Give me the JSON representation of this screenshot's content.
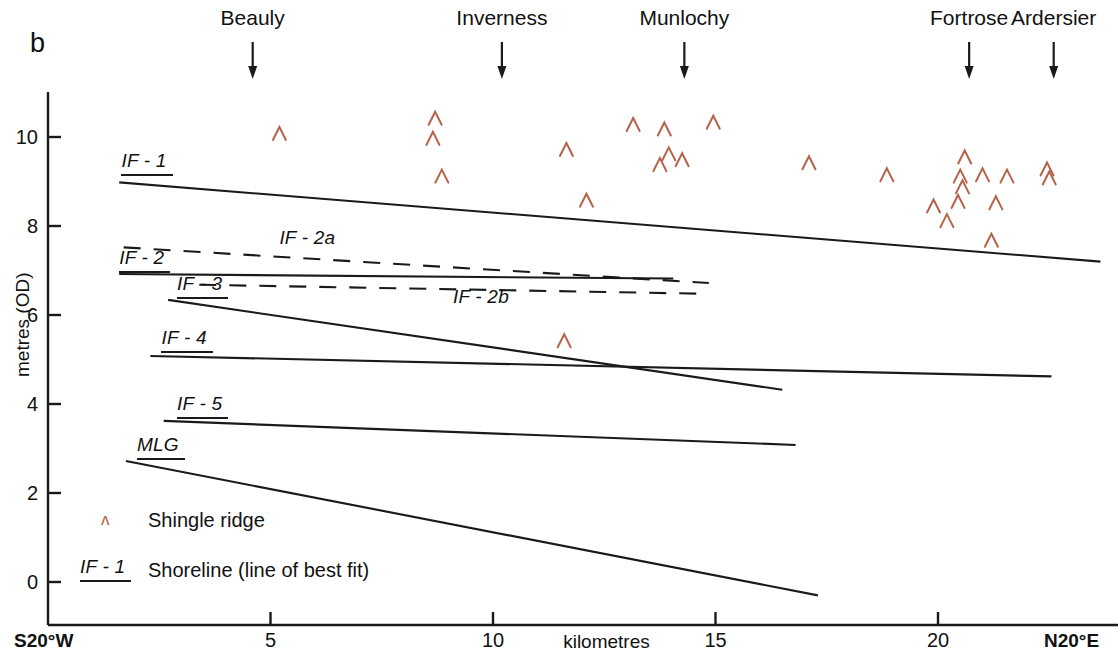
{
  "figure": {
    "panel_letter": "b",
    "background_color": "#ffffff",
    "line_color": "#1a1a1a",
    "marker_color": "#b5634a"
  },
  "axes": {
    "y_title": "metres (OD)",
    "x_title": "kilometres",
    "y_ticks": [
      {
        "value": 0,
        "label": "0"
      },
      {
        "value": 2,
        "label": "2"
      },
      {
        "value": 4,
        "label": "4"
      },
      {
        "value": 6,
        "label": "6"
      },
      {
        "value": 8,
        "label": "8"
      },
      {
        "value": 10,
        "label": "10"
      }
    ],
    "x_ticks": [
      {
        "value": 5,
        "label": "5"
      },
      {
        "value": 10,
        "label": "10"
      },
      {
        "value": 15,
        "label": "15"
      },
      {
        "value": 20,
        "label": "20"
      }
    ],
    "x_start_label": "S20°W",
    "x_end_label": "N20°E",
    "xlim": [
      0,
      23.8
    ],
    "ylim": [
      -1.0,
      10.9
    ],
    "grid": false
  },
  "locations": [
    {
      "name": "Beauly",
      "km": 4.6
    },
    {
      "name": "Inverness",
      "km": 10.2
    },
    {
      "name": "Munlochy",
      "km": 14.3
    },
    {
      "name": "Fortrose",
      "km": 20.7
    },
    {
      "name": "Ardersier",
      "km": 22.6
    }
  ],
  "legend": {
    "marker_glyph": "ʌ",
    "marker_label": "Shingle ridge",
    "line_key": "IF - 1",
    "line_label": "Shoreline (line of best fit)"
  },
  "chart_data": {
    "type": "scatter",
    "title": "",
    "xlabel": "kilometres",
    "ylabel": "metres (OD)",
    "xlim": [
      0,
      23.8
    ],
    "ylim": [
      -1.0,
      10.9
    ],
    "grid": false,
    "legend_position": "lower-left",
    "series": [
      {
        "name": "Shingle ridge",
        "type": "scatter",
        "marker": "caret",
        "color": "#b5634a",
        "points": [
          [
            5.2,
            10.08
          ],
          [
            8.7,
            10.42
          ],
          [
            8.65,
            9.97
          ],
          [
            8.85,
            9.12
          ],
          [
            11.65,
            9.72
          ],
          [
            12.1,
            8.58
          ],
          [
            13.15,
            10.28
          ],
          [
            13.85,
            10.18
          ],
          [
            14.95,
            10.33
          ],
          [
            13.95,
            9.62
          ],
          [
            14.25,
            9.49
          ],
          [
            13.75,
            9.38
          ],
          [
            17.1,
            9.42
          ],
          [
            18.85,
            9.15
          ],
          [
            20.6,
            9.55
          ],
          [
            20.5,
            9.12
          ],
          [
            20.55,
            8.88
          ],
          [
            21.0,
            9.15
          ],
          [
            21.55,
            9.12
          ],
          [
            20.45,
            8.55
          ],
          [
            21.3,
            8.52
          ],
          [
            19.9,
            8.45
          ],
          [
            20.2,
            8.12
          ],
          [
            21.2,
            7.68
          ],
          [
            22.45,
            9.28
          ],
          [
            22.5,
            9.08
          ],
          [
            11.6,
            5.42
          ]
        ]
      }
    ],
    "shorelines": [
      {
        "label": "IF - 1",
        "style": "solid",
        "label_underline": true,
        "x1": 1.6,
        "y1": 8.98,
        "x2": 23.65,
        "y2": 7.2,
        "label_x": 1.65,
        "label_y": 9.4
      },
      {
        "label": "IF - 2",
        "style": "solid",
        "label_underline": true,
        "x1": 1.6,
        "y1": 6.92,
        "x2": 14.05,
        "y2": 6.82,
        "label_x": 1.6,
        "label_y": 7.22
      },
      {
        "label": "IF - 2a",
        "style": "dashed",
        "label_underline": false,
        "x1": 1.7,
        "y1": 7.52,
        "x2": 14.85,
        "y2": 6.72,
        "label_x": 5.2,
        "label_y": 7.66
      },
      {
        "label": "IF - 2b",
        "style": "dashed",
        "label_underline": false,
        "x1": 3.4,
        "y1": 6.68,
        "x2": 14.6,
        "y2": 6.48,
        "label_x": 9.1,
        "label_y": 6.34
      },
      {
        "label": "IF - 3",
        "style": "solid",
        "label_underline": true,
        "x1": 2.7,
        "y1": 6.34,
        "x2": 16.5,
        "y2": 4.32,
        "label_x": 2.9,
        "label_y": 6.62
      },
      {
        "label": "IF - 4",
        "style": "solid",
        "label_underline": true,
        "x1": 2.3,
        "y1": 5.08,
        "x2": 22.55,
        "y2": 4.62,
        "label_x": 2.55,
        "label_y": 5.42
      },
      {
        "label": "IF - 5",
        "style": "solid",
        "label_underline": true,
        "x1": 2.6,
        "y1": 3.62,
        "x2": 16.8,
        "y2": 3.08,
        "label_x": 2.9,
        "label_y": 3.94
      },
      {
        "label": "MLG",
        "style": "solid",
        "label_underline": true,
        "x1": 1.75,
        "y1": 2.72,
        "x2": 17.3,
        "y2": -0.3,
        "label_x": 2.0,
        "label_y": 3.02
      }
    ]
  }
}
